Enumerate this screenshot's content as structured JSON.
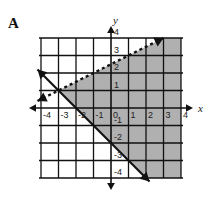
{
  "panel": {
    "label": "A"
  },
  "chart_data": {
    "type": "line",
    "title": "",
    "xlabel": "x",
    "ylabel": "y",
    "xlim": [
      -4,
      4
    ],
    "ylim": [
      -4,
      4
    ],
    "grid": true,
    "xticks": [
      "-4",
      "-3",
      "-2",
      "-1",
      "0",
      "1",
      "2",
      "3",
      "4"
    ],
    "yticks": [
      "-4",
      "-3",
      "-2",
      "-1",
      "1",
      "2",
      "3",
      "4"
    ],
    "series": [
      {
        "name": "boundary-dashed",
        "style": "dashed",
        "slope": 0.5,
        "intercept": 2.5,
        "points": [
          [
            -4.2,
            0.4
          ],
          [
            3.0,
            4.0
          ]
        ],
        "arrows": "both"
      },
      {
        "name": "boundary-solid",
        "style": "solid",
        "slope": -1,
        "intercept": -2,
        "points": [
          [
            -4.2,
            2.2
          ],
          [
            2.2,
            -4.2
          ]
        ],
        "arrows": "both"
      }
    ],
    "shaded_region": {
      "description": "below dashed line and above-right of solid line",
      "color": "#b0b0b0",
      "inequalities": [
        "y < 0.5x + 2.5",
        "y >= -x - 2"
      ]
    }
  }
}
